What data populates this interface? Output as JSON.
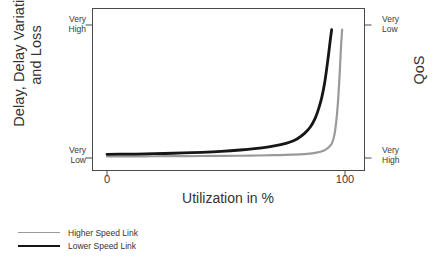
{
  "chart_data": {
    "type": "line",
    "title": "",
    "xlabel": "Utilization in %",
    "ylabel_left_line1": "Delay, Delay Variation",
    "ylabel_left_line2": "and Loss",
    "ylabel_right": "QoS",
    "xlim": [
      0,
      106
    ],
    "ylim": [
      0,
      1
    ],
    "grid": false,
    "legend_position": "below-left",
    "x_ticks": [
      {
        "value": 0,
        "label": "0"
      },
      {
        "value": 100,
        "label": "100"
      }
    ],
    "y_ticks_left": [
      {
        "value": 1,
        "label_line1": "Very",
        "label_line2": "High"
      },
      {
        "value": 0,
        "label_line1": "Very",
        "label_line2": "Low"
      }
    ],
    "y_ticks_right": [
      {
        "value": 1,
        "label_line1": "Very",
        "label_line2": "Low"
      },
      {
        "value": 0,
        "label_line1": "Very",
        "label_line2": "High"
      }
    ],
    "series": [
      {
        "name": "Higher Speed Link",
        "color": "#9a9a9a",
        "width": 2.2,
        "x": [
          0,
          10,
          20,
          30,
          40,
          50,
          60,
          70,
          78,
          84,
          88,
          91,
          93,
          94.5,
          95.5,
          96.3,
          97,
          97.6,
          98,
          98.4,
          98.8
        ],
        "y": [
          0.012,
          0.012,
          0.013,
          0.014,
          0.015,
          0.016,
          0.018,
          0.021,
          0.025,
          0.031,
          0.04,
          0.055,
          0.078,
          0.11,
          0.17,
          0.27,
          0.41,
          0.58,
          0.72,
          0.86,
          0.965
        ]
      },
      {
        "name": "Lower Speed Link",
        "color": "#161616",
        "width": 2.8,
        "x": [
          0,
          8,
          16,
          24,
          32,
          40,
          48,
          56,
          62,
          68,
          73,
          77,
          80,
          83,
          85.5,
          87.5,
          89,
          90.3,
          91.4,
          92.3,
          93.1,
          93.8,
          94.4
        ],
        "y": [
          0.028,
          0.029,
          0.031,
          0.034,
          0.038,
          0.043,
          0.05,
          0.06,
          0.07,
          0.084,
          0.1,
          0.12,
          0.145,
          0.185,
          0.235,
          0.3,
          0.375,
          0.46,
          0.56,
          0.67,
          0.78,
          0.885,
          0.965
        ]
      }
    ]
  },
  "legend": {
    "items": [
      {
        "label": "Higher Speed Link"
      },
      {
        "label": "Lower Speed Link"
      }
    ]
  }
}
